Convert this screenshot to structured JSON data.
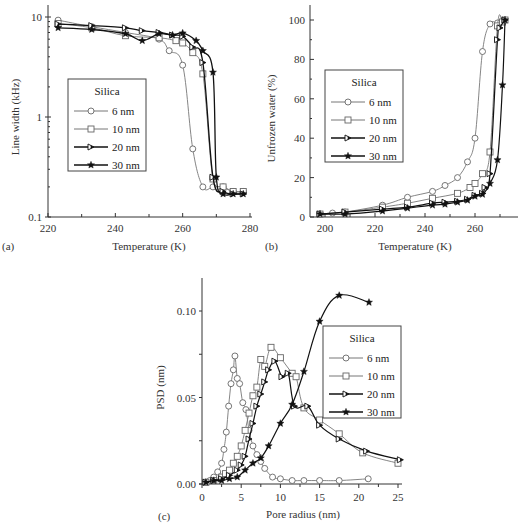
{
  "chart_data": [
    {
      "id": "a",
      "panel_label": "(a)",
      "type": "line",
      "xlabel": "Temperature (K)",
      "ylabel": "Line width (kHz)",
      "xlim": [
        220,
        280
      ],
      "ylim": [
        0.1,
        10
      ],
      "yscale": "log",
      "xticks": [
        220,
        240,
        260,
        280
      ],
      "yticks": [
        0.1,
        1,
        10
      ],
      "ytick_labels": [
        "0.1",
        "1",
        "10"
      ],
      "legend": {
        "title": "Silica",
        "position": "center-left"
      },
      "series": [
        {
          "name": "6 nm",
          "marker": "open-circle",
          "color": "#777777",
          "x": [
            223,
            233,
            243,
            253,
            256,
            260,
            263,
            266,
            269,
            272,
            275,
            278
          ],
          "y": [
            9.3,
            8.0,
            7.0,
            6.0,
            4.6,
            3.3,
            0.48,
            0.2,
            0.2,
            0.2,
            0.18,
            0.18
          ]
        },
        {
          "name": "10 nm",
          "marker": "open-square",
          "color": "#777777",
          "x": [
            223,
            233,
            243,
            253,
            258,
            260,
            263,
            266,
            269,
            272,
            275,
            278
          ],
          "y": [
            8.6,
            7.8,
            6.5,
            6.2,
            5.8,
            5.5,
            4.4,
            2.7,
            0.24,
            0.2,
            0.18,
            0.18
          ]
        },
        {
          "name": "20 nm",
          "marker": "half-filled-triangle",
          "color": "#222222",
          "x": [
            223,
            233,
            243,
            248,
            253,
            257,
            260,
            263,
            266,
            269,
            272,
            275,
            278
          ],
          "y": [
            8.5,
            8.2,
            7.8,
            7.3,
            7.0,
            6.6,
            6.4,
            5.0,
            3.5,
            0.25,
            0.18,
            0.17,
            0.17
          ]
        },
        {
          "name": "30 nm",
          "marker": "filled-star",
          "color": "#111111",
          "x": [
            223,
            233,
            243,
            248,
            253,
            257,
            260,
            264,
            266,
            269,
            270,
            272,
            275,
            278
          ],
          "y": [
            7.8,
            7.5,
            6.8,
            5.8,
            6.8,
            6.6,
            6.9,
            5.8,
            4.6,
            2.8,
            0.25,
            0.17,
            0.17,
            0.17
          ]
        }
      ]
    },
    {
      "id": "b",
      "panel_label": "(b)",
      "type": "line",
      "xlabel": "Temperature (K)",
      "ylabel": "Unfrozen water (%)",
      "xlim": [
        194,
        275
      ],
      "ylim": [
        0,
        104
      ],
      "xticks": [
        200,
        220,
        240,
        260
      ],
      "yticks": [
        0,
        20,
        40,
        60,
        80,
        100
      ],
      "legend": {
        "title": "Silica",
        "position": "center-left"
      },
      "series": [
        {
          "name": "6 nm",
          "marker": "open-circle",
          "color": "#777777",
          "x": [
            198,
            203,
            208,
            223,
            233,
            243,
            248,
            253,
            257,
            260,
            263,
            266,
            269,
            272
          ],
          "y": [
            1.5,
            2,
            2.5,
            6,
            10,
            13,
            16,
            20,
            28,
            40,
            84,
            98,
            98.5,
            100
          ]
        },
        {
          "name": "10 nm",
          "marker": "open-square",
          "color": "#777777",
          "x": [
            198,
            208,
            223,
            233,
            243,
            253,
            258,
            260,
            263,
            266,
            269,
            271,
            272
          ],
          "y": [
            1.5,
            2.5,
            5,
            7,
            9.5,
            12,
            15,
            17,
            22,
            33,
            97,
            99,
            100
          ]
        },
        {
          "name": "20 nm",
          "marker": "half-filled-triangle",
          "color": "#333333",
          "x": [
            198,
            208,
            223,
            233,
            243,
            248,
            253,
            257,
            260,
            263,
            264,
            266,
            269,
            270,
            272
          ],
          "y": [
            1.5,
            2.5,
            4,
            5,
            7,
            7.5,
            8,
            9,
            11,
            12,
            15,
            22,
            90,
            96,
            100
          ]
        },
        {
          "name": "30 nm",
          "marker": "filled-star",
          "color": "#111111",
          "x": [
            198,
            208,
            223,
            233,
            243,
            248,
            253,
            257,
            260,
            263,
            266,
            269,
            271,
            272
          ],
          "y": [
            1.5,
            1.5,
            3,
            4.5,
            6,
            6.5,
            7.5,
            8.5,
            10.5,
            11.5,
            17,
            29,
            67,
            100
          ]
        }
      ]
    },
    {
      "id": "c",
      "panel_label": "(c)",
      "type": "line",
      "xlabel": "Pore radius (nm)",
      "ylabel": "PSD (nm)",
      "xlim": [
        0,
        25.5
      ],
      "ylim": [
        0,
        0.119
      ],
      "xticks": [
        0,
        5,
        10,
        15,
        20,
        25
      ],
      "yticks": [
        0.0,
        0.05,
        0.1
      ],
      "ytick_labels": [
        "0.00",
        "0.05",
        "0.10"
      ],
      "legend": {
        "title": "Silica",
        "position": "center-right"
      },
      "series": [
        {
          "name": "6 nm",
          "marker": "open-circle",
          "color": "#777777",
          "x": [
            0.5,
            1.0,
            1.5,
            2.0,
            2.5,
            2.8,
            3.1,
            3.4,
            3.7,
            4.0,
            4.2,
            4.5,
            4.8,
            5.2,
            5.6,
            6.0,
            6.5,
            7.0,
            7.5,
            8.0,
            9.0,
            10.0,
            11.5,
            13.0,
            15.0,
            17.5,
            21.2
          ],
          "y": [
            0.001,
            0.002,
            0.004,
            0.007,
            0.012,
            0.02,
            0.03,
            0.045,
            0.058,
            0.066,
            0.074,
            0.061,
            0.058,
            0.047,
            0.043,
            0.031,
            0.022,
            0.017,
            0.013,
            0.009,
            0.004,
            0.003,
            0.002,
            0.002,
            0.002,
            0.002,
            0.003
          ]
        },
        {
          "name": "10 nm",
          "marker": "open-square",
          "color": "#777777",
          "x": [
            0.5,
            1.5,
            2.5,
            3.0,
            3.5,
            4.0,
            4.5,
            5.0,
            5.5,
            6.0,
            6.5,
            7.0,
            7.5,
            8.0,
            8.8,
            10.0,
            11.5,
            12.0,
            13.0,
            15.0,
            17.5,
            20.5,
            25.0
          ],
          "y": [
            0.001,
            0.002,
            0.004,
            0.006,
            0.008,
            0.012,
            0.016,
            0.022,
            0.031,
            0.041,
            0.051,
            0.056,
            0.072,
            0.068,
            0.079,
            0.073,
            0.064,
            0.062,
            0.044,
            0.037,
            0.029,
            0.018,
            0.012
          ]
        },
        {
          "name": "20 nm",
          "marker": "half-filled-triangle",
          "color": "#222222",
          "x": [
            0.5,
            1.5,
            2.5,
            3.5,
            4.5,
            5.0,
            5.5,
            6.0,
            6.5,
            7.0,
            7.5,
            8.0,
            8.5,
            9.3,
            10.2,
            11.0,
            11.8,
            13.5,
            15.0,
            17.5,
            21.0,
            25.3
          ],
          "y": [
            0.001,
            0.002,
            0.003,
            0.005,
            0.008,
            0.011,
            0.016,
            0.026,
            0.035,
            0.045,
            0.052,
            0.059,
            0.066,
            0.071,
            0.062,
            0.064,
            0.045,
            0.045,
            0.034,
            0.026,
            0.019,
            0.014
          ]
        },
        {
          "name": "30 nm",
          "marker": "filled-star",
          "color": "#111111",
          "x": [
            0.5,
            1.5,
            2.5,
            3.5,
            4.5,
            5.5,
            6.5,
            7.5,
            8.5,
            10.0,
            11.5,
            13.0,
            15.0,
            17.5,
            21.3
          ],
          "y": [
            0.001,
            0.002,
            0.002,
            0.003,
            0.004,
            0.008,
            0.012,
            0.015,
            0.022,
            0.035,
            0.046,
            0.065,
            0.094,
            0.109,
            0.105
          ]
        }
      ]
    }
  ],
  "layout": {
    "a": {
      "x0": 48,
      "x1": 250,
      "yTop": 17,
      "yBot": 217,
      "axisTop": 5
    },
    "b": {
      "xAxis0": 310,
      "x200": 325,
      "pxPerUnit": 2.5,
      "y0": 217,
      "y100": 20,
      "axisTop": 5
    },
    "c": {
      "x0": 202,
      "x25": 398,
      "y0": 484,
      "y010": 311,
      "axisTop": 278
    }
  }
}
